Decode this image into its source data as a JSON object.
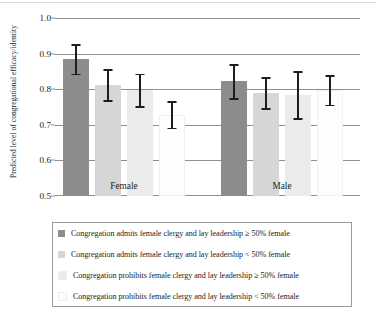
{
  "chart_data": {
    "type": "bar",
    "title": "",
    "xlabel": "",
    "ylabel": "Predicted level of congregational efficacy/identity",
    "ylim": [
      0.5,
      1.0
    ],
    "yticks": [
      "1.0",
      "0.9",
      "0.8",
      "0.7",
      "0.6",
      "0.5"
    ],
    "ytick_values": [
      1.0,
      0.9,
      0.8,
      0.7,
      0.6,
      0.5
    ],
    "grid": "horizontal",
    "legend_position": "below-axes",
    "categories": [
      "Female",
      "Male"
    ],
    "series": [
      {
        "name": "Congregation admits female clergy and lay leadership ≥ 50% female",
        "color": "#8c8c8c",
        "values": [
          0.885,
          0.823
        ],
        "err_low": [
          0.843,
          0.775
        ],
        "err_high": [
          0.927,
          0.871
        ]
      },
      {
        "name": "Congregation admits female clergy and lay leadership < 50% female",
        "color": "#d6d6d6",
        "values": [
          0.813,
          0.79
        ],
        "err_low": [
          0.769,
          0.747
        ],
        "err_high": [
          0.857,
          0.833
        ]
      },
      {
        "name": "Congregation prohibits female clergy and lay leadership ≥ 50% female",
        "color": "#ebebeb",
        "values": [
          0.798,
          0.785
        ],
        "err_low": [
          0.753,
          0.719
        ],
        "err_high": [
          0.843,
          0.851
        ]
      },
      {
        "name": "Congregation prohibits female clergy and lay leadership < 50% female",
        "color": "#fdfdfd",
        "values": [
          0.728,
          0.798
        ],
        "err_low": [
          0.692,
          0.756
        ],
        "err_high": [
          0.766,
          0.84
        ]
      }
    ]
  }
}
